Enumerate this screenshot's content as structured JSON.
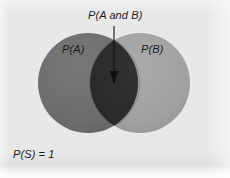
{
  "diagram": {
    "type": "venn-diagram",
    "title_label": "P(A and B)",
    "sample_space_label": "P(S) = 1",
    "sets": [
      {
        "id": "A",
        "label": "P(A)",
        "color": "#6e6e6e",
        "cx": 88,
        "cy": 83,
        "r": 50
      },
      {
        "id": "B",
        "label": "P(B)",
        "color": "#a0a0a0",
        "cx": 140,
        "cy": 83,
        "r": 50
      }
    ],
    "intersection": {
      "label": "P(A and B)",
      "color": "#2b2b2b"
    },
    "annotation": {
      "arrow_label": "P(A and B)",
      "arrow_from_y": 26,
      "arrow_to_y": 84,
      "arrow_x": 114,
      "color": "#111111"
    },
    "background_color": "#e8e8e8"
  }
}
